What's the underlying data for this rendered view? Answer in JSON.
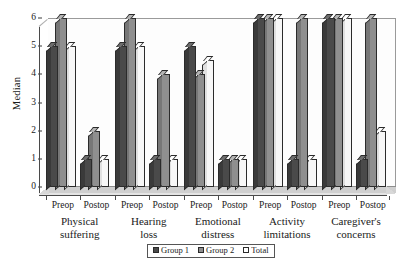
{
  "chart_data": {
    "type": "bar",
    "title": "",
    "xlabel": "",
    "ylabel": "Median",
    "ylim": [
      0,
      6
    ],
    "yticks": [
      0,
      1,
      2,
      3,
      4,
      5,
      6
    ],
    "grid": false,
    "legend_position": "bottom",
    "categories": [
      "Preop",
      "Postop",
      "Preop",
      "Postop",
      "Preop",
      "Postop",
      "Preop",
      "Postop",
      "Preop",
      "Postop"
    ],
    "group_labels": [
      "Physical suffering",
      "Hearing loss",
      "Emotional distress",
      "Activity limitations",
      "Caregiver's concerns"
    ],
    "group_labels_lines": [
      [
        "Physical",
        "suffering"
      ],
      [
        "Hearing",
        "loss"
      ],
      [
        "Emotional",
        "distress"
      ],
      [
        "Activity",
        "limitations"
      ],
      [
        "Caregiver's",
        "concerns"
      ]
    ],
    "series": [
      {
        "name": "Group 1",
        "color": "#4a4a4a",
        "values": [
          5,
          1,
          5,
          1,
          5,
          1,
          6,
          1,
          6,
          1
        ]
      },
      {
        "name": "Group 2",
        "color": "#8f8f8f",
        "values": [
          6,
          2,
          6,
          4,
          4,
          1,
          6,
          6,
          6,
          6
        ]
      },
      {
        "name": "Total",
        "color": "#ffffff",
        "values": [
          5,
          1,
          5,
          1,
          4.5,
          1,
          6,
          1,
          6,
          2
        ]
      }
    ]
  },
  "legend": {
    "items": [
      {
        "label": "Group 1",
        "swatch": "legend-swatch-group-1"
      },
      {
        "label": "Group 2",
        "swatch": "legend-swatch-group-2"
      },
      {
        "label": "Total",
        "swatch": "legend-swatch-total"
      }
    ]
  },
  "axis": {
    "y_title": "Median",
    "y_tick_labels": [
      "0",
      "1",
      "2",
      "3",
      "4",
      "5",
      "6"
    ]
  }
}
